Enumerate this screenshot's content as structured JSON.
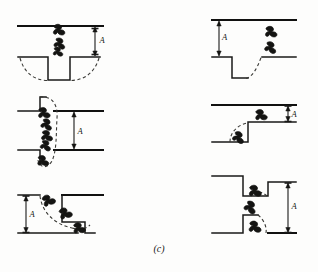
{
  "figure": {
    "caption": "(c)",
    "dimension_label": "A",
    "panel_count": 6,
    "ink_color": "#1a1a18",
    "dashed_color": "#3a3a36",
    "background_color": "#fdfdfc"
  },
  "panels": [
    {
      "id": "panel-1",
      "position": "top-left",
      "dimension_label": "A",
      "dimension_side": "right",
      "description": "Upper horizontal surface with rectangular upward notch on lower surface; dashed arcs sweep downward on both sides",
      "particle_count": 3
    },
    {
      "id": "panel-2",
      "position": "top-right",
      "dimension_label": "A",
      "dimension_side": "left",
      "description": "Upper horizontal surface with downward rectangular trench on lower surface; dashed arc rises out of trench to the right",
      "particle_count": 2
    },
    {
      "id": "panel-3",
      "position": "middle-left",
      "dimension_label": "A",
      "dimension_side": "right",
      "description": "Two offset horizontal surfaces with short vertical steps; tall dashed ellipse spans the gap containing a vertical chain of particles",
      "particle_count": 5
    },
    {
      "id": "panel-4",
      "position": "middle-right",
      "dimension_label": "A",
      "dimension_side": "right",
      "description": "Upper horizontal surface; lower surface steps upward; dashed arc curves around the convex corner",
      "particle_count": 2
    },
    {
      "id": "panel-5",
      "position": "bottom-left",
      "dimension_label": "A",
      "dimension_side": "left",
      "description": "Tall downward step at left with dashed trajectory sweeping down and right into a notch",
      "particle_count": 3
    },
    {
      "id": "panel-6",
      "position": "bottom-right",
      "dimension_label": "A",
      "dimension_side": "right",
      "description": "Upper and lower surfaces each step inward forming a narrowed channel; dashed arcs with particles inside the gap",
      "particle_count": 3
    }
  ]
}
